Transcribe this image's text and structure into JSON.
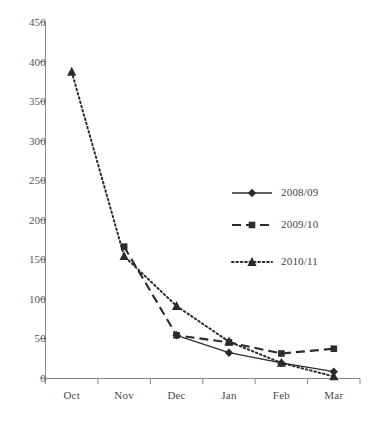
{
  "chart_data": {
    "type": "line",
    "title": "",
    "subtitle": "",
    "xlabel": "",
    "ylabel": "",
    "categories": [
      "Oct",
      "Nov",
      "Dec",
      "Jan",
      "Feb",
      "Mar"
    ],
    "ylim": [
      0,
      450
    ],
    "yticks": [
      0,
      50,
      100,
      150,
      200,
      250,
      300,
      350,
      400,
      450
    ],
    "ytick_labels": [
      "0",
      "50",
      "100",
      "150",
      "200",
      "250",
      "300",
      "350",
      "400",
      "450"
    ],
    "grid": false,
    "legend_position": "center-right",
    "series": [
      {
        "name": "2008/09",
        "values": [
          null,
          null,
          54,
          32,
          19,
          8
        ],
        "marker": "diamond",
        "line_style": "solid",
        "color": "#2b2b2b"
      },
      {
        "name": "2009/10",
        "values": [
          null,
          166,
          54,
          45,
          31,
          37
        ],
        "marker": "square",
        "line_style": "dashed",
        "color": "#2b2b2b"
      },
      {
        "name": "2010/11",
        "values": [
          387,
          154,
          91,
          46,
          19,
          2
        ],
        "marker": "triangle",
        "line_style": "dotted",
        "color": "#2b2b2b"
      }
    ]
  },
  "legend": {
    "entries": [
      {
        "label": "2008/09"
      },
      {
        "label": "2009/10"
      },
      {
        "label": "2010/11"
      }
    ]
  },
  "axis": {
    "axis_color": "#808080",
    "text_color": "#555555"
  }
}
